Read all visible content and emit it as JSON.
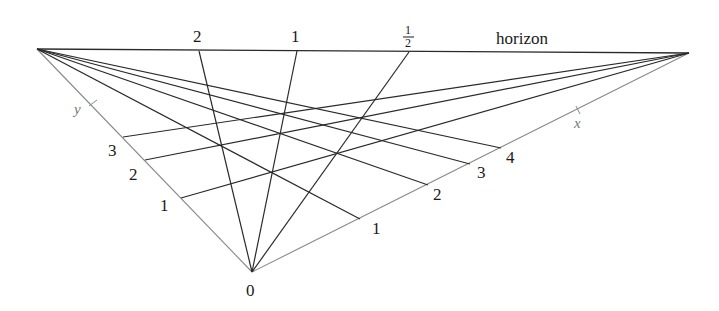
{
  "diagram": {
    "horizon_label": "horizon",
    "origin_label": "0",
    "x_axis_label": "x",
    "y_axis_label": "y",
    "colors": {
      "line": "#2a2a2a",
      "axis": "#888888",
      "text": "#1a1a1a"
    },
    "vanishing_points": {
      "left": [
        37,
        49
      ],
      "right": [
        689,
        53
      ]
    },
    "origin": [
      252,
      272
    ],
    "horizon_points": [
      {
        "label": "2",
        "pos": [
          199,
          51
        ]
      },
      {
        "label": "1",
        "pos": [
          297,
          51
        ]
      },
      {
        "label": "1/2",
        "pos": [
          409,
          52
        ]
      }
    ],
    "y_ticks": [
      {
        "label": "1",
        "pos": [
          181,
          198
        ]
      },
      {
        "label": "2",
        "pos": [
          145,
          160
        ]
      },
      {
        "label": "3",
        "pos": [
          123,
          137
        ]
      }
    ],
    "x_ticks": [
      {
        "label": "1",
        "pos": [
          360,
          219
        ]
      },
      {
        "label": "2",
        "pos": [
          428,
          185
        ]
      },
      {
        "label": "3",
        "pos": [
          470,
          164
        ]
      },
      {
        "label": "4",
        "pos": [
          501,
          148
        ]
      }
    ]
  }
}
